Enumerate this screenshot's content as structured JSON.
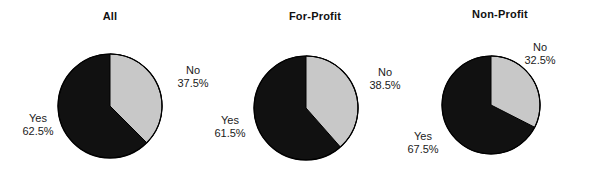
{
  "figure": {
    "width": 592,
    "height": 181,
    "background": "#ffffff"
  },
  "colors": {
    "yes_slice": "#111111",
    "no_slice": "#c8c8c8",
    "outline": "#000000",
    "text": "#1a1a1a"
  },
  "chart_data": [
    {
      "type": "pie",
      "title": "All",
      "labels": [
        "No",
        "Yes"
      ],
      "values": [
        37.5,
        62.5
      ],
      "value_labels": [
        "37.5%",
        "62.5%"
      ],
      "colors": [
        "#c8c8c8",
        "#111111"
      ],
      "start_angle_deg": 0,
      "direction": "clockwise",
      "legend": "none"
    },
    {
      "type": "pie",
      "title": "For-Profit",
      "labels": [
        "No",
        "Yes"
      ],
      "values": [
        38.5,
        61.5
      ],
      "value_labels": [
        "38.5%",
        "61.5%"
      ],
      "colors": [
        "#c8c8c8",
        "#111111"
      ],
      "start_angle_deg": 0,
      "direction": "clockwise",
      "legend": "none"
    },
    {
      "type": "pie",
      "title": "Non-Profit",
      "labels": [
        "No",
        "Yes"
      ],
      "values": [
        32.5,
        67.5
      ],
      "value_labels": [
        "32.5%",
        "67.5%"
      ],
      "colors": [
        "#c8c8c8",
        "#111111"
      ],
      "start_angle_deg": 0,
      "direction": "clockwise",
      "legend": "none"
    }
  ],
  "panels": [
    {
      "title": "All",
      "no_name": "No",
      "no_value": "37.5%",
      "yes_name": "Yes",
      "yes_value": "62.5%"
    },
    {
      "title": "For-Profit",
      "no_name": "No",
      "no_value": "38.5%",
      "yes_name": "Yes",
      "yes_value": "61.5%"
    },
    {
      "title": "Non-Profit",
      "no_name": "No",
      "no_value": "32.5%",
      "yes_name": "Yes",
      "yes_value": "67.5%"
    }
  ]
}
